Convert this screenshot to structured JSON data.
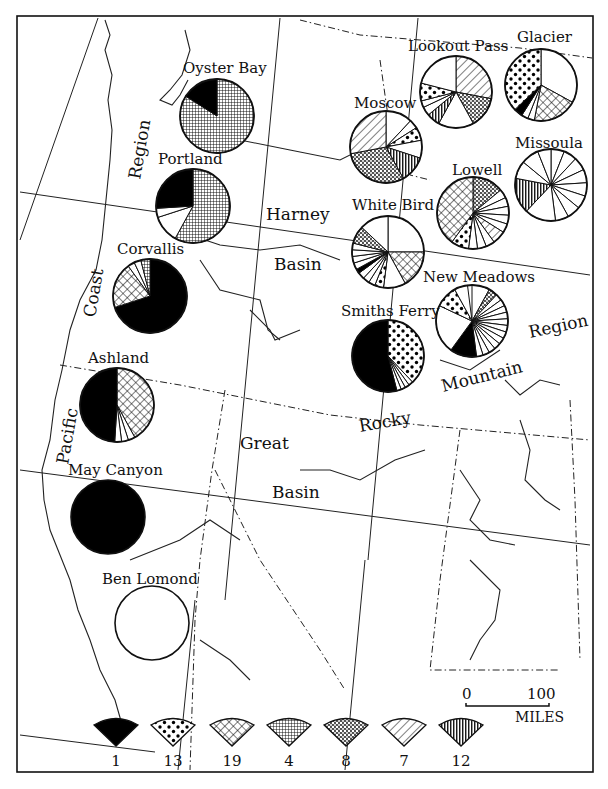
{
  "chart_data": {
    "type": "pie",
    "title": "",
    "legend": [
      {
        "id": "p1",
        "label": "1",
        "pattern": "solid-black"
      },
      {
        "id": "p13",
        "label": "13",
        "pattern": "large-dots"
      },
      {
        "id": "p19",
        "label": "19",
        "pattern": "crosshatch"
      },
      {
        "id": "p4",
        "label": "4",
        "pattern": "fine-dots"
      },
      {
        "id": "p8",
        "label": "8",
        "pattern": "stipple"
      },
      {
        "id": "p7",
        "label": "7",
        "pattern": "diagonal-lines"
      },
      {
        "id": "p12",
        "label": "12",
        "pattern": "vertical-lines"
      }
    ],
    "sites": [
      {
        "name": "Oyster Bay",
        "cx": 217,
        "cy": 116,
        "r": 37,
        "slices": [
          {
            "type": "p4",
            "pct": 84
          },
          {
            "type": "p1",
            "pct": 16
          }
        ]
      },
      {
        "name": "Portland",
        "cx": 193,
        "cy": 206,
        "r": 37,
        "slices": [
          {
            "type": "p4",
            "pct": 58
          },
          {
            "type": "white",
            "pct": 12
          },
          {
            "type": "white",
            "pct": 4
          },
          {
            "type": "p1",
            "pct": 26
          }
        ]
      },
      {
        "name": "Corvallis",
        "cx": 150,
        "cy": 296,
        "r": 37,
        "slices": [
          {
            "type": "p1",
            "pct": 70
          },
          {
            "type": "p19",
            "pct": 20
          },
          {
            "type": "white",
            "pct": 3
          },
          {
            "type": "white",
            "pct": 3
          },
          {
            "type": "p4",
            "pct": 4
          }
        ]
      },
      {
        "name": "Ashland",
        "cx": 117,
        "cy": 405,
        "r": 37,
        "slices": [
          {
            "type": "p19",
            "pct": 42
          },
          {
            "type": "white",
            "pct": 3
          },
          {
            "type": "white",
            "pct": 3
          },
          {
            "type": "white",
            "pct": 3
          },
          {
            "type": "p1",
            "pct": 49
          }
        ]
      },
      {
        "name": "May Canyon",
        "cx": 108,
        "cy": 517,
        "r": 37,
        "slices": [
          {
            "type": "p1",
            "pct": 100
          }
        ]
      },
      {
        "name": "Ben Lomond",
        "cx": 152,
        "cy": 623,
        "r": 37,
        "slices": [
          {
            "type": "white",
            "pct": 100
          }
        ]
      },
      {
        "name": "Lookout Pass",
        "cx": 456,
        "cy": 92,
        "r": 36,
        "slices": [
          {
            "type": "p7",
            "pct": 28
          },
          {
            "type": "p8",
            "pct": 14
          },
          {
            "type": "white",
            "pct": 16
          },
          {
            "type": "p12",
            "pct": 6
          },
          {
            "type": "white",
            "pct": 4
          },
          {
            "type": "white",
            "pct": 3
          },
          {
            "type": "p13",
            "pct": 8
          },
          {
            "type": "white",
            "pct": 21
          }
        ]
      },
      {
        "name": "Glacier",
        "cx": 541,
        "cy": 85,
        "r": 36,
        "slices": [
          {
            "type": "white",
            "pct": 33
          },
          {
            "type": "p19",
            "pct": 20
          },
          {
            "type": "white",
            "pct": 3
          },
          {
            "type": "white",
            "pct": 3
          },
          {
            "type": "p1",
            "pct": 4
          },
          {
            "type": "p13",
            "pct": 37
          }
        ]
      },
      {
        "name": "Moscow",
        "cx": 386,
        "cy": 147,
        "r": 36,
        "slices": [
          {
            "type": "white",
            "pct": 12
          },
          {
            "type": "white",
            "pct": 4
          },
          {
            "type": "p13",
            "pct": 6
          },
          {
            "type": "white",
            "pct": 8
          },
          {
            "type": "p12",
            "pct": 12
          },
          {
            "type": "p8",
            "pct": 30
          },
          {
            "type": "p7",
            "pct": 28
          }
        ]
      },
      {
        "name": "Missoula",
        "cx": 551,
        "cy": 185,
        "r": 36,
        "slices": [
          {
            "type": "white",
            "pct": 6
          },
          {
            "type": "white",
            "pct": 6
          },
          {
            "type": "white",
            "pct": 6
          },
          {
            "type": "white",
            "pct": 6
          },
          {
            "type": "white",
            "pct": 6
          },
          {
            "type": "white",
            "pct": 6
          },
          {
            "type": "white",
            "pct": 6
          },
          {
            "type": "white",
            "pct": 6
          },
          {
            "type": "white",
            "pct": 14
          },
          {
            "type": "p12",
            "pct": 16
          },
          {
            "type": "white",
            "pct": 8
          },
          {
            "type": "white",
            "pct": 8
          },
          {
            "type": "white",
            "pct": 6
          }
        ]
      },
      {
        "name": "Lowell",
        "cx": 473,
        "cy": 213,
        "r": 36,
        "slices": [
          {
            "type": "p8",
            "pct": 14
          },
          {
            "type": "white",
            "pct": 4
          },
          {
            "type": "white",
            "pct": 4
          },
          {
            "type": "white",
            "pct": 4
          },
          {
            "type": "white",
            "pct": 4
          },
          {
            "type": "white",
            "pct": 4
          },
          {
            "type": "p7",
            "pct": 6
          },
          {
            "type": "white",
            "pct": 4
          },
          {
            "type": "white",
            "pct": 4
          },
          {
            "type": "white",
            "pct": 4
          },
          {
            "type": "p13",
            "pct": 8
          },
          {
            "type": "p19",
            "pct": 40
          }
        ]
      },
      {
        "name": "White Bird",
        "cx": 388,
        "cy": 252,
        "r": 36,
        "slices": [
          {
            "type": "white",
            "pct": 25
          },
          {
            "type": "p19",
            "pct": 17
          },
          {
            "type": "white",
            "pct": 10
          },
          {
            "type": "p13",
            "pct": 4
          },
          {
            "type": "white",
            "pct": 3
          },
          {
            "type": "white",
            "pct": 3
          },
          {
            "type": "white",
            "pct": 3
          },
          {
            "type": "p1",
            "pct": 2
          },
          {
            "type": "white",
            "pct": 3
          },
          {
            "type": "white",
            "pct": 3
          },
          {
            "type": "white",
            "pct": 3
          },
          {
            "type": "white",
            "pct": 3
          },
          {
            "type": "p8",
            "pct": 8
          },
          {
            "type": "white",
            "pct": 13
          }
        ]
      },
      {
        "name": "New Meadows",
        "cx": 472,
        "cy": 321,
        "r": 36,
        "slices": [
          {
            "type": "white",
            "pct": 8
          },
          {
            "type": "p8",
            "pct": 4
          },
          {
            "type": "white",
            "pct": 3
          },
          {
            "type": "white",
            "pct": 3
          },
          {
            "type": "white",
            "pct": 3
          },
          {
            "type": "white",
            "pct": 3
          },
          {
            "type": "white",
            "pct": 3
          },
          {
            "type": "white",
            "pct": 3
          },
          {
            "type": "white",
            "pct": 3
          },
          {
            "type": "white",
            "pct": 3
          },
          {
            "type": "white",
            "pct": 3
          },
          {
            "type": "white",
            "pct": 3
          },
          {
            "type": "white",
            "pct": 3
          },
          {
            "type": "white",
            "pct": 3
          },
          {
            "type": "p1",
            "pct": 12
          },
          {
            "type": "white",
            "pct": 22
          },
          {
            "type": "p13",
            "pct": 10
          },
          {
            "type": "white",
            "pct": 6
          }
        ]
      },
      {
        "name": "Smiths Ferry",
        "cx": 388,
        "cy": 356,
        "r": 36,
        "slices": [
          {
            "type": "p13",
            "pct": 38
          },
          {
            "type": "white",
            "pct": 2
          },
          {
            "type": "white",
            "pct": 2
          },
          {
            "type": "white",
            "pct": 2
          },
          {
            "type": "white",
            "pct": 2
          },
          {
            "type": "p1",
            "pct": 54
          }
        ]
      }
    ]
  },
  "labels": {
    "cities": {
      "oyster_bay": "Oyster Bay",
      "portland": "Portland",
      "corvallis": "Corvallis",
      "ashland": "Ashland",
      "may_canyon": "May Canyon",
      "ben_lomond": "Ben Lomond",
      "lookout_pass": "Lookout Pass",
      "glacier": "Glacier",
      "moscow": "Moscow",
      "missoula": "Missoula",
      "lowell": "Lowell",
      "white_bird": "White Bird",
      "new_meadows": "New Meadows",
      "smiths_ferry": "Smiths Ferry"
    },
    "regions": {
      "region_nw": "Region",
      "coast": "Coast",
      "pacific": "Pacific",
      "harney": "Harney",
      "basin_1": "Basin",
      "great": "Great",
      "basin_2": "Basin",
      "rocky": "Rocky",
      "mountain": "Mountain",
      "region_e": "Region"
    },
    "scale": {
      "zero": "0",
      "hundred": "100",
      "units": "MILES"
    },
    "legend_numbers": [
      "1",
      "13",
      "19",
      "4",
      "8",
      "7",
      "12"
    ]
  }
}
